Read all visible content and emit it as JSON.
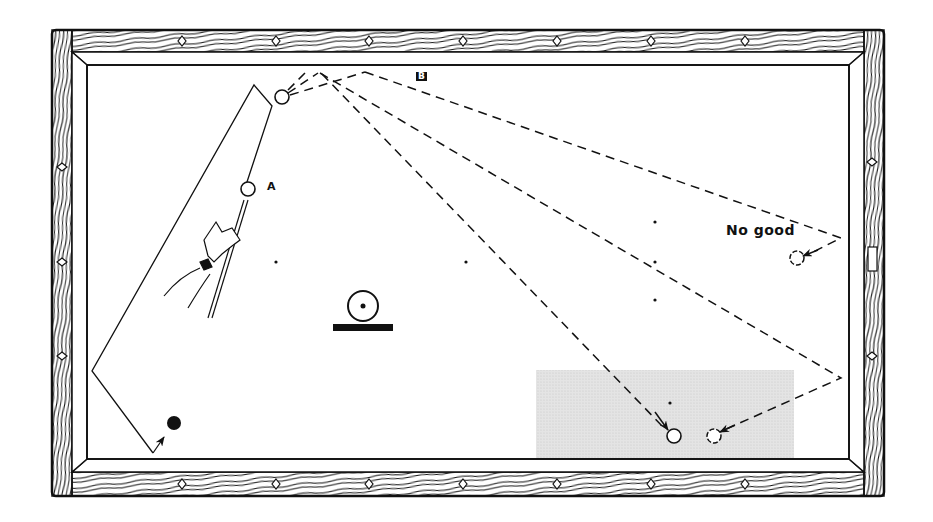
{
  "figure": {
    "type": "billiards-table-diagram",
    "labels": {
      "ball_a": "A",
      "path_b": "B",
      "no_good": "No good"
    },
    "colors": {
      "line": "#111111",
      "shaded_zone": "#dcdcdc",
      "background": "#ffffff"
    },
    "table": {
      "outer": {
        "x": 50,
        "y": 28,
        "w": 835,
        "h": 468
      },
      "cushion_inner": {
        "x": 86,
        "y": 62,
        "w": 763,
        "h": 396
      },
      "top_diamonds_x": [
        182,
        276,
        369,
        463,
        557,
        651,
        745
      ],
      "bottom_diamonds_x": [
        182,
        276,
        369,
        463,
        557,
        651,
        745
      ],
      "left_diamonds_y": [
        168,
        262,
        356
      ],
      "right_diamonds_y": [
        162,
        262,
        356
      ]
    },
    "elements": {
      "object_ball_top": {
        "x": 282,
        "y": 97,
        "r": 7
      },
      "cue_ball_a": {
        "x": 248,
        "y": 189,
        "r": 7
      },
      "black_ball": {
        "x": 174,
        "y": 423,
        "r": 7
      },
      "no_good_ball": {
        "x": 797,
        "y": 258,
        "r": 7
      },
      "pocket_ball_1": {
        "x": 674,
        "y": 436,
        "r": 7
      },
      "pocket_ball_2": {
        "x": 714,
        "y": 436,
        "r": 7
      },
      "spots": [
        {
          "x": 276,
          "y": 262
        },
        {
          "x": 466,
          "y": 262
        },
        {
          "x": 655,
          "y": 222
        },
        {
          "x": 655,
          "y": 262
        },
        {
          "x": 655,
          "y": 300
        },
        {
          "x": 670,
          "y": 403
        }
      ],
      "head_spot_symbol": {
        "x": 363,
        "y": 306
      }
    },
    "shaded_zone": {
      "x": 536,
      "y": 370,
      "w": 258,
      "h": 88
    }
  }
}
